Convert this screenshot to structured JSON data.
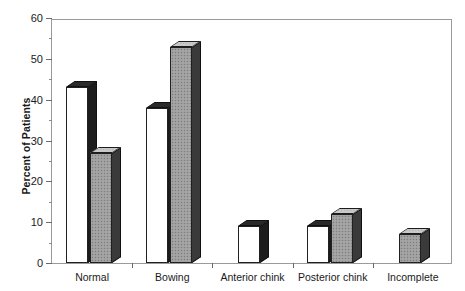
{
  "chart_data": {
    "type": "bar",
    "title": "",
    "xlabel": "",
    "ylabel": "Percent of Patients",
    "ylim": [
      0,
      60
    ],
    "ytick_step": 10,
    "yminor_step": 5,
    "grid": false,
    "legend": "none",
    "categories": [
      "Normal",
      "Bowing",
      "Anterior chink",
      "Posterior chink",
      "Incomplete"
    ],
    "yticks": [
      "0",
      "10",
      "20",
      "30",
      "40",
      "50",
      "60"
    ],
    "series": [
      {
        "name": "white",
        "fill": "#ffffff",
        "values": [
          43,
          38,
          9,
          9,
          null
        ]
      },
      {
        "name": "grey",
        "fill": "#9e9e9e",
        "values": [
          27,
          53,
          null,
          12,
          7
        ]
      }
    ]
  },
  "axis": {
    "y_title": "Percent of Patients"
  },
  "colors": {
    "frame": "#9a9a9a",
    "bar_outline": "#202020",
    "bar_side": "#1c1c1c",
    "white_fill": "#ffffff",
    "grey_fill": "#9e9e9e",
    "text": "#1a1a1a"
  }
}
